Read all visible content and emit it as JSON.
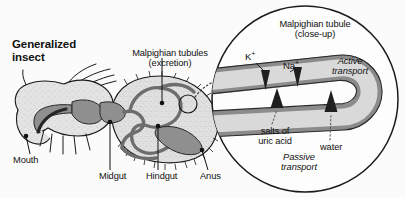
{
  "figure": {
    "kind": "biology-diagram",
    "background_color": "#fbfbfb"
  },
  "insect_panel": {
    "title": "Generalized\ninsect",
    "tubules_callout": "Malpighian tubules\n(excretion)",
    "parts": [
      {
        "key": "mouth",
        "label": "Mouth"
      },
      {
        "key": "midgut",
        "label": "Midgut"
      },
      {
        "key": "hindgut",
        "label": "Hindgut"
      },
      {
        "key": "anus",
        "label": "Anus"
      }
    ],
    "colors": {
      "body_fill": "#e2e2e2",
      "body_outline": "#1a1a1a",
      "gut_fill": "#8f8f8f",
      "gut_outline": "#262626",
      "tubule_stroke": "#6d6d6d"
    }
  },
  "inset_panel": {
    "title": "Malpighian tubule\n(close-up)",
    "circle_outline_color": "#1a1a1a",
    "tubule": {
      "wall_color": "#8b8b8b",
      "lumen_color": "#d9d9d9"
    },
    "inward_labels": [
      {
        "key": "potassium",
        "label": "K",
        "charge": "+"
      },
      {
        "key": "sodium",
        "label": "Na",
        "charge": "+"
      }
    ],
    "outward_labels": [
      {
        "key": "salts",
        "label": "salts of\nuric acid"
      },
      {
        "key": "water",
        "label": "water"
      }
    ],
    "transport_modes": [
      {
        "key": "active",
        "label": "Active\ntransport"
      },
      {
        "key": "passive",
        "label": "Passive\ntransport"
      }
    ]
  }
}
